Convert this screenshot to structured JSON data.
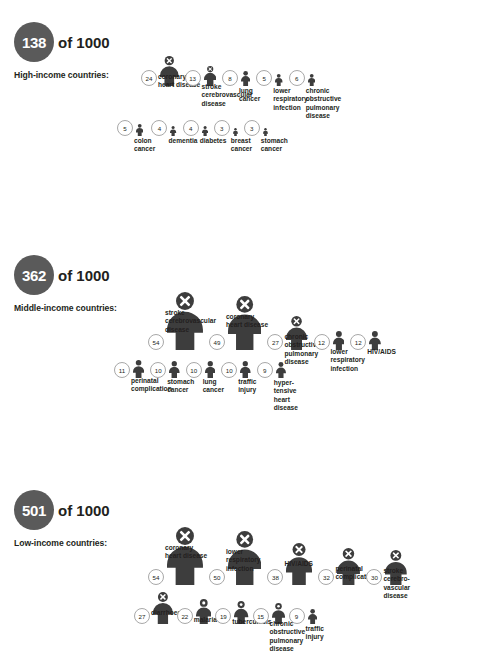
{
  "palette": {
    "figure": "#3d3d3d",
    "badge_circle": "#5a5a5a",
    "badge_text": "#ffffff",
    "count_border": "#a8a8a8",
    "text": "#231f20",
    "background": "#ffffff"
  },
  "chart_data": {
    "type": "pictogram",
    "unit": "deaths per 1000",
    "xlabel": "",
    "ylabel": "",
    "legend": "Figure size is proportional to the number of deaths per 1000",
    "groups": [
      {
        "total": "138",
        "of_label": "of 1000",
        "caption": "High-income countries:",
        "categories": [
          "coronary heart disease",
          "stroke cerebrovascular disease",
          "lung cancer",
          "lower respiratory infection",
          "chronic obstructive pulmonary disease",
          "colon cancer",
          "dementia",
          "diabetes",
          "breast cancer",
          "stomach cancer"
        ],
        "values": [
          24,
          13,
          8,
          5,
          6,
          5,
          4,
          4,
          3,
          3
        ]
      },
      {
        "total": "362",
        "of_label": "of 1000",
        "caption": "Middle-income countries:",
        "categories": [
          "stroke cerebrovascular disease",
          "coronary heart disease",
          "chronic obstructive pulmonary disease",
          "lower respiratory infection",
          "HIV/AIDS",
          "perinatal complication",
          "stomach cancer",
          "lung cancer",
          "traffic injury",
          "hyper-tensive heart disease"
        ],
        "values": [
          54,
          49,
          27,
          12,
          12,
          11,
          10,
          10,
          10,
          9
        ]
      },
      {
        "total": "501",
        "of_label": "of 1000",
        "caption": "Low-income countries:",
        "categories": [
          "coronary heart disease",
          "lower respiratory infection",
          "HIV/AIDS",
          "perinatal complication",
          "stroke cerebrovascular disease",
          "diarrhoea",
          "malaria",
          "tuberculosis",
          "chronic obstructive pulmonary disease",
          "traffic injury"
        ],
        "values": [
          54,
          50,
          38,
          32,
          30,
          27,
          22,
          19,
          15,
          9
        ]
      }
    ]
  },
  "sections": [
    {
      "total": "138",
      "of_label": "of 1000",
      "caption": "High-income countries:",
      "rows": [
        {
          "left": 141,
          "top": 56,
          "items": [
            {
              "count": "24",
              "label": "coronary\nheart disease",
              "scale": 30,
              "cross": true,
              "gap": 3,
              "label_w": 62,
              "space": 6
            },
            {
              "count": "13",
              "label": "stroke\ncerebrovascular\ndisease",
              "scale": 20,
              "cross": true,
              "gap": 3,
              "label_w": 62,
              "space": 6
            },
            {
              "count": "8",
              "label": "lung\ncancer",
              "scale": 15,
              "cross": false,
              "gap": 3,
              "label_w": 42,
              "space": 6
            },
            {
              "count": "5",
              "label": "lower\nrespiratory\ninfection",
              "scale": 12,
              "cross": false,
              "gap": 3,
              "label_w": 52,
              "space": 6
            },
            {
              "count": "6",
              "label": "chronic\nobstructive\npulmonary\ndisease",
              "scale": 12,
              "cross": false,
              "gap": 3,
              "label_w": 50,
              "space": 0
            }
          ]
        },
        {
          "left": 117,
          "top": 120,
          "items": [
            {
              "count": "5",
              "label": "colon\ncancer",
              "scale": 12,
              "cross": false,
              "gap": 3,
              "label_w": 40,
              "space": 8
            },
            {
              "count": "4",
              "label": "dementia",
              "scale": 10,
              "cross": false,
              "gap": 3,
              "label_w": 38,
              "space": 6
            },
            {
              "count": "4",
              "label": "diabetes",
              "scale": 10,
              "cross": false,
              "gap": 3,
              "label_w": 36,
              "space": 6
            },
            {
              "count": "3",
              "label": "breast\ncancer",
              "scale": 8,
              "cross": false,
              "gap": 3,
              "label_w": 34,
              "space": 6
            },
            {
              "count": "3",
              "label": "stomach\ncancer",
              "scale": 8,
              "cross": false,
              "gap": 3,
              "label_w": 38,
              "space": 0
            }
          ]
        }
      ]
    },
    {
      "total": "362",
      "of_label": "of 1000",
      "caption": "Middle-income countries:",
      "rows": [
        {
          "left": 148,
          "top": 292,
          "items": [
            {
              "count": "54",
              "label": "stroke\ncerebrovascular\ndisease",
              "scale": 58,
              "cross": true,
              "gap": 3,
              "label_w": 66,
              "space": 6
            },
            {
              "count": "49",
              "label": "coronary\nheart disease",
              "scale": 54,
              "cross": true,
              "gap": 3,
              "label_w": 62,
              "space": 6
            },
            {
              "count": "27",
              "label": "chronic\nobstructive\npulmonary\ndisease",
              "scale": 34,
              "cross": true,
              "gap": 3,
              "label_w": 50,
              "space": 6
            },
            {
              "count": "12",
              "label": "lower\nrespiratory\ninfection",
              "scale": 19,
              "cross": false,
              "gap": 3,
              "label_w": 48,
              "space": 6
            },
            {
              "count": "12",
              "label": "HIV/AIDS",
              "scale": 19,
              "cross": false,
              "gap": 3,
              "label_w": 40,
              "space": 0
            }
          ]
        },
        {
          "left": 114,
          "top": 360,
          "items": [
            {
              "count": "11",
              "label": "perinatal\ncomplication",
              "scale": 18,
              "cross": false,
              "gap": 3,
              "label_w": 54,
              "space": 6
            },
            {
              "count": "10",
              "label": "stomach\ncancer",
              "scale": 17,
              "cross": false,
              "gap": 3,
              "label_w": 42,
              "space": 6
            },
            {
              "count": "10",
              "label": "lung\ncancer",
              "scale": 17,
              "cross": false,
              "gap": 3,
              "label_w": 38,
              "space": 6
            },
            {
              "count": "10",
              "label": "traffic\ninjury",
              "scale": 17,
              "cross": false,
              "gap": 3,
              "label_w": 34,
              "space": 6
            },
            {
              "count": "9",
              "label": "hyper-\ntensive\nheart\ndisease",
              "scale": 16,
              "cross": false,
              "gap": 3,
              "label_w": 38,
              "space": 0
            }
          ]
        }
      ]
    },
    {
      "total": "501",
      "of_label": "of 1000",
      "caption": "Low-income countries:",
      "rows": [
        {
          "left": 148,
          "top": 527,
          "items": [
            {
              "count": "54",
              "label": "coronary\nheart disease",
              "scale": 58,
              "cross": true,
              "gap": 3,
              "label_w": 62,
              "space": 6
            },
            {
              "count": "50",
              "label": "lower\nrespiratory\ninfection",
              "scale": 54,
              "cross": true,
              "gap": 3,
              "label_w": 56,
              "space": 6
            },
            {
              "count": "38",
              "label": "HIV/AIDS",
              "scale": 42,
              "cross": true,
              "gap": 3,
              "label_w": 46,
              "space": 6
            },
            {
              "count": "32",
              "label": "perinatal\ncomplication",
              "scale": 37,
              "cross": true,
              "gap": 3,
              "label_w": 52,
              "space": 6
            },
            {
              "count": "30",
              "label": "stroke\ncerebro-\nvascular\ndisease",
              "scale": 35,
              "cross": true,
              "gap": 3,
              "label_w": 46,
              "space": 0
            }
          ]
        },
        {
          "left": 134,
          "top": 592,
          "items": [
            {
              "count": "27",
              "label": "diarrhoea",
              "scale": 32,
              "cross": true,
              "gap": 3,
              "label_w": 44,
              "space": 4
            },
            {
              "count": "22",
              "label": "malaria",
              "scale": 25,
              "cross": false,
              "gap": 3,
              "label_w": 34,
              "space": 4
            },
            {
              "count": "19",
              "label": "tuberculosis",
              "scale": 23,
              "cross": false,
              "gap": 3,
              "label_w": 48,
              "space": 4
            },
            {
              "count": "15",
              "label": "chronic\nobstructive\npulmonary\ndisease",
              "scale": 21,
              "cross": false,
              "gap": 3,
              "label_w": 46,
              "space": 4
            },
            {
              "count": "9",
              "label": "traffic\ninjury",
              "scale": 15,
              "cross": false,
              "gap": 3,
              "label_w": 30,
              "space": 0
            }
          ]
        }
      ]
    }
  ],
  "section_tops": [
    22,
    255,
    490
  ],
  "footer_note": "disease"
}
